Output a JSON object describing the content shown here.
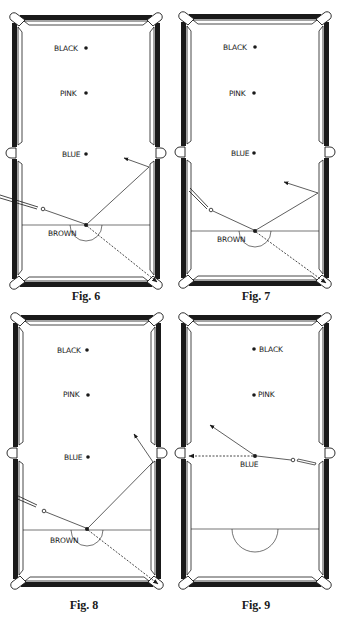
{
  "figures": [
    {
      "id": "fig6",
      "caption": "Fig. 6",
      "balls": {
        "black": "BLACK",
        "pink": "PINK",
        "blue": "BLUE",
        "brown": "BROWN"
      },
      "shot": "cue ball strikes brown; brown goes to corner pocket (dashed), cue ball rebounds off side cushion"
    },
    {
      "id": "fig7",
      "caption": "Fig. 7",
      "balls": {
        "black": "BLACK",
        "pink": "PINK",
        "blue": "BLUE",
        "brown": "BROWN"
      },
      "shot": "cue ball strikes brown; brown to corner pocket, cue ball rebounds at shallower angle"
    },
    {
      "id": "fig8",
      "caption": "Fig. 8",
      "balls": {
        "black": "BLACK",
        "pink": "PINK",
        "blue": "BLUE",
        "brown": "BROWN"
      },
      "shot": "cue ball strikes brown; brown to corner pocket, cue ball rebounds near middle pocket"
    },
    {
      "id": "fig9",
      "caption": "Fig. 9",
      "balls": {
        "black": "BLACK",
        "pink": "PINK",
        "blue": "BLUE"
      },
      "shot": "cue ball strikes blue; blue to middle pocket (dashed), cue ball deflects upward-left"
    }
  ],
  "colors": {
    "ink": "#1a1a1a",
    "paper": "#ffffff"
  }
}
